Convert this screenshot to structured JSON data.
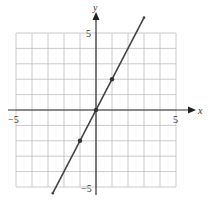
{
  "chart_data": {
    "type": "line",
    "title": "",
    "xlabel": "x",
    "ylabel": "y",
    "xlim": [
      -5,
      5
    ],
    "ylim": [
      -5,
      5
    ],
    "grid": true,
    "tick_labels": {
      "x_neg": "−5",
      "x_pos": "5",
      "y_pos": "5",
      "y_neg": "−5"
    },
    "series": [
      {
        "name": "y = 2x",
        "equation": "y = 2x",
        "x": [
          -2.7,
          3.0
        ],
        "y": [
          -5.4,
          6.0
        ],
        "marked_points": [
          {
            "x": -1,
            "y": -2
          },
          {
            "x": 0,
            "y": 0
          },
          {
            "x": 1,
            "y": 2
          }
        ]
      }
    ]
  },
  "colors": {
    "grid": "#bdbdbd",
    "axis": "#333333",
    "line": "#444444"
  }
}
